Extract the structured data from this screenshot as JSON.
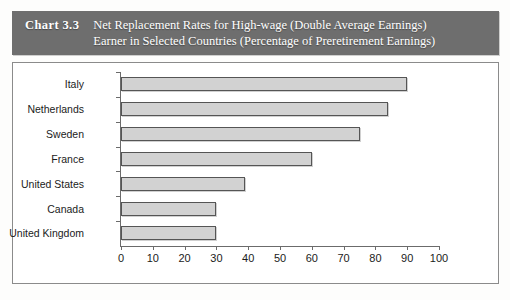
{
  "title": {
    "chart_number": "Chart 3.3",
    "line1": "Net Replacement Rates for High-wage (Double Average Earnings)",
    "line2": "Earner in Selected Countries (Percentage of Preretirement Earnings)"
  },
  "colors": {
    "title_band": "#6e6e6e",
    "title_text": "#ffffff",
    "bar_fill": "#d2d2d2",
    "bar_border": "#555555",
    "panel_background": "#ffffff",
    "panel_border": "#8b8b8b",
    "axis": "#6b6b6b"
  },
  "chart_data": {
    "type": "bar",
    "orientation": "horizontal",
    "title": "Chart 3.3 Net Replacement Rates for High-wage (Double Average Earnings) Earner in Selected Countries (Percentage of Preretirement Earnings)",
    "xlabel": "",
    "ylabel": "",
    "xlim": [
      0,
      100
    ],
    "xticks": [
      0,
      10,
      20,
      30,
      40,
      50,
      60,
      70,
      80,
      90,
      100
    ],
    "grid": false,
    "legend": false,
    "categories": [
      "Italy",
      "Netherlands",
      "Sweden",
      "France",
      "United States",
      "Canada",
      "United Kingdom"
    ],
    "values": [
      90,
      84,
      75,
      60,
      39,
      30,
      30
    ]
  }
}
